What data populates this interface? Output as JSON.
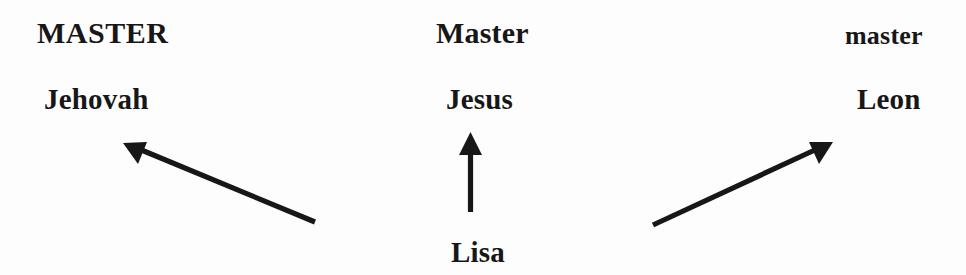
{
  "diagram": {
    "type": "semantic-mapping",
    "background_color": "#fdfdfd",
    "ink_color": "#171717",
    "senses": [
      {
        "id": "master-upper",
        "label": "MASTER"
      },
      {
        "id": "master-title",
        "label": "Master"
      },
      {
        "id": "master-lower",
        "label": "master"
      }
    ],
    "referents": [
      {
        "id": "jehovah",
        "label": "Jehovah"
      },
      {
        "id": "jesus",
        "label": "Jesus"
      },
      {
        "id": "leon",
        "label": "Leon"
      }
    ],
    "source": {
      "id": "lisa",
      "label": "Lisa"
    },
    "arrows": [
      {
        "id": "lisa-to-jehovah",
        "direction": "up-left",
        "from": "Lisa",
        "to": "Jehovah"
      },
      {
        "id": "lisa-to-jesus",
        "direction": "up",
        "from": "Lisa",
        "to": "Jesus"
      },
      {
        "id": "lisa-to-leon",
        "direction": "up-right",
        "from": "Lisa",
        "to": "Leon"
      }
    ]
  }
}
